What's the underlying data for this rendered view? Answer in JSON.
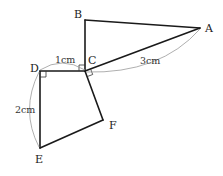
{
  "figure": {
    "vertices": [
      {
        "id": "A",
        "label": "A"
      },
      {
        "id": "B",
        "label": "B"
      },
      {
        "id": "C",
        "label": "C"
      },
      {
        "id": "D",
        "label": "D"
      },
      {
        "id": "E",
        "label": "E"
      },
      {
        "id": "F",
        "label": "F"
      }
    ],
    "triangle": [
      "A",
      "B",
      "C"
    ],
    "quadrilateral": [
      "C",
      "D",
      "E",
      "F"
    ],
    "right_angles": [
      "B-C-D",
      "A-C-F",
      "C-D-E"
    ],
    "measurements": [
      {
        "segment": "DC",
        "label": "1cm"
      },
      {
        "segment": "CA",
        "label": "3cm"
      },
      {
        "segment": "DE",
        "label": "2cm"
      }
    ]
  },
  "colors": {
    "edge": "#1a1a1a",
    "arc": "#9a9a9a"
  }
}
